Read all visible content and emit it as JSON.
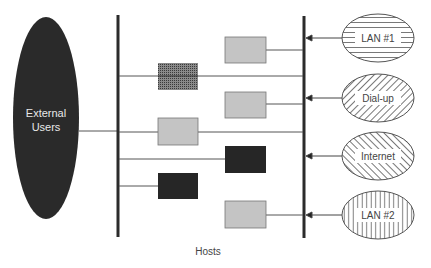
{
  "diagram": {
    "external": {
      "line1": "External",
      "line2": "Users"
    },
    "hosts_label": "Hosts",
    "networks": [
      {
        "id": "lan1",
        "label": "LAN #1",
        "pattern": "horizontal-hatch"
      },
      {
        "id": "dialup",
        "label": "Dial-up",
        "pattern": "backslash-hatch"
      },
      {
        "id": "internet",
        "label": "Internet",
        "pattern": "slash-hatch"
      },
      {
        "id": "lan2",
        "label": "LAN #2",
        "pattern": "vertical-hatch"
      }
    ],
    "hosts": [
      {
        "id": "host-a",
        "fill": "light-gray"
      },
      {
        "id": "host-b",
        "fill": "grid"
      },
      {
        "id": "host-c",
        "fill": "light-gray"
      },
      {
        "id": "host-d",
        "fill": "light-gray"
      },
      {
        "id": "host-e",
        "fill": "black"
      },
      {
        "id": "host-f",
        "fill": "black"
      },
      {
        "id": "host-g",
        "fill": "light-gray"
      }
    ],
    "colors": {
      "external_fill": "#2a2a2a",
      "bus": "#2b2b2b",
      "host_light": "#c4c4c4",
      "host_dark": "#262626",
      "line": "#555555",
      "text_on_dark": "#e8e8e8",
      "text": "#444444"
    }
  }
}
